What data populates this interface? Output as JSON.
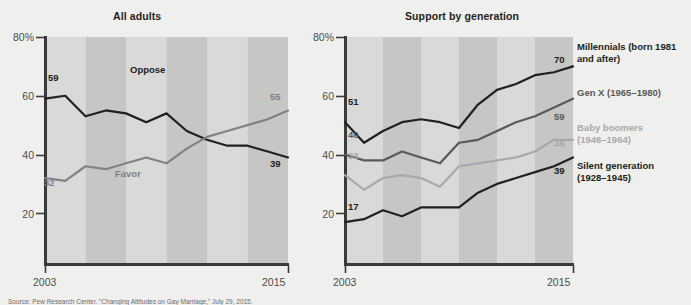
{
  "background_color": "#efefed",
  "source_note": "Source: Pew Research Center. \"Changing Attitudes on Gay Marriage,\" July 29, 2015.",
  "colors": {
    "dark": "#231f20",
    "mid_dark": "#58595b",
    "mid": "#808285",
    "light": "#a7a9ac",
    "axis": "#3a3a3c",
    "tick_text": "#4d4d4d",
    "band_light": "#d9d9d7",
    "band_dark": "#c6c6c4"
  },
  "axis": {
    "y_ticks": [
      "80%",
      "60",
      "40",
      "20"
    ],
    "y_values": [
      80,
      60,
      40,
      20
    ],
    "x_ticks": [
      "2003",
      "2015"
    ],
    "y_min": 0,
    "y_max": 80
  },
  "chart_data": [
    {
      "type": "line",
      "title": "All adults",
      "xlabel": "",
      "ylabel": "",
      "ylim": [
        0,
        80
      ],
      "grid": false,
      "legend_position": "inline",
      "x": [
        2003,
        2004,
        2005,
        2006,
        2007,
        2008,
        2009,
        2010,
        2011,
        2012,
        2013,
        2014,
        2015
      ],
      "series": [
        {
          "name": "Oppose",
          "color": "#231f20",
          "values": [
            59,
            60,
            53,
            55,
            54,
            51,
            54,
            48,
            45,
            43,
            43,
            41,
            39
          ],
          "start_label": "59",
          "end_label": "39"
        },
        {
          "name": "Favor",
          "color": "#808285",
          "values": [
            32,
            31,
            36,
            35,
            37,
            39,
            37,
            42,
            46,
            48,
            50,
            52,
            55
          ],
          "start_label": "32",
          "end_label": "55"
        }
      ]
    },
    {
      "type": "line",
      "title": "Support by generation",
      "xlabel": "",
      "ylabel": "",
      "ylim": [
        0,
        80
      ],
      "grid": false,
      "legend_position": "right",
      "x": [
        2003,
        2004,
        2005,
        2006,
        2007,
        2008,
        2009,
        2010,
        2011,
        2012,
        2013,
        2014,
        2015
      ],
      "series": [
        {
          "name": "Millennials (born 1981 and after)",
          "color": "#231f20",
          "values": [
            51,
            44,
            48,
            51,
            52,
            51,
            49,
            57,
            62,
            64,
            67,
            68,
            70
          ],
          "start_label": "51",
          "end_label": "70"
        },
        {
          "name": "Gen X (1965–1980)",
          "color": "#58595b",
          "values": [
            40,
            38,
            38,
            41,
            39,
            37,
            44,
            45,
            48,
            51,
            53,
            56,
            59
          ],
          "start_label": "40",
          "end_label": "59"
        },
        {
          "name": "Baby boomers (1946–1964)",
          "color": "#a7a9ac",
          "values": [
            33,
            28,
            32,
            33,
            32,
            29,
            36,
            37,
            38,
            39,
            41,
            45,
            45
          ],
          "start_label": "33",
          "end_label": "45"
        },
        {
          "name": "Silent generation (1928–1945)",
          "color": "#231f20",
          "values": [
            17,
            18,
            21,
            19,
            22,
            22,
            22,
            27,
            30,
            32,
            34,
            36,
            39
          ],
          "start_label": "17",
          "end_label": "39"
        }
      ]
    }
  ],
  "left_chart": {
    "title": "All adults",
    "inline_labels": [
      {
        "text": "Oppose",
        "color": "#231f20"
      },
      {
        "text": "Favor",
        "color": "#808285"
      }
    ],
    "point_labels": {
      "oppose_start": "59",
      "oppose_end": "39",
      "favor_start": "32",
      "favor_end": "55"
    },
    "x_start": "2003",
    "x_end": "2015"
  },
  "right_chart": {
    "title": "Support by generation",
    "point_labels": {
      "millennials_start": "51",
      "millennials_end": "70",
      "genx_start": "40",
      "genx_end": "59",
      "boomers_start": "33",
      "boomers_end": "45",
      "silent_start": "17",
      "silent_end": "39"
    },
    "legend": [
      {
        "line1": "Millennials (born 1981",
        "line2": "and after)",
        "color": "#231f20"
      },
      {
        "line1": "Gen X (1965–1980)",
        "line2": "",
        "color": "#58595b"
      },
      {
        "line1": "Baby boomers",
        "line2": "(1946–1964)",
        "color": "#a7a9ac"
      },
      {
        "line1": "Silent generation",
        "line2": "(1928–1945)",
        "color": "#231f20"
      }
    ],
    "x_start": "2003",
    "x_end": "2015"
  }
}
